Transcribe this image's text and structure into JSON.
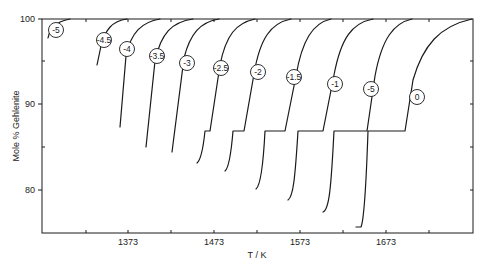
{
  "chart_data": {
    "type": "line",
    "title": "",
    "xlabel": "T / K",
    "ylabel": "Mole % Gehlenite",
    "xlim": [
      1273,
      1773
    ],
    "ylim": [
      75,
      100
    ],
    "x_ticks": [
      1323,
      1373,
      1423,
      1473,
      1523,
      1573,
      1623,
      1673,
      1723
    ],
    "x_tick_labels": [
      "",
      "1373",
      "",
      "1473",
      "",
      "1573",
      "",
      "1673",
      ""
    ],
    "y_ticks": [
      100,
      95,
      90,
      85,
      80
    ],
    "y_tick_labels": [
      "100",
      "",
      "90",
      "",
      "80"
    ],
    "grid": false,
    "legend": "none (curves labelled inline with circled values)",
    "series": [
      {
        "name": "-5",
        "label": "-5",
        "points": [
          [
            1280,
            97.8
          ],
          [
            1290,
            99.0
          ],
          [
            1300,
            99.7
          ],
          [
            1305,
            100
          ]
        ]
      },
      {
        "name": "-4.5",
        "label": "-4.5",
        "points": [
          [
            1337,
            94.4
          ],
          [
            1340,
            96.4
          ],
          [
            1352,
            99.2
          ],
          [
            1370,
            100
          ]
        ]
      },
      {
        "name": "-4",
        "label": "-4",
        "points": [
          [
            1363,
            87.2
          ],
          [
            1370,
            96.0
          ],
          [
            1385,
            99.3
          ],
          [
            1410,
            100
          ]
        ]
      },
      {
        "name": "-3.5",
        "label": "-3.5",
        "points": [
          [
            1392,
            85.0
          ],
          [
            1402,
            95.4
          ],
          [
            1420,
            99.2
          ],
          [
            1447,
            100
          ]
        ]
      },
      {
        "name": "-3",
        "label": "-3",
        "points": [
          [
            1422,
            84.3
          ],
          [
            1435,
            95.0
          ],
          [
            1452,
            99.3
          ],
          [
            1477,
            100
          ]
        ]
      },
      {
        "name": "-2.5",
        "label": "-2.5",
        "points": [
          [
            1451,
            83.0
          ],
          [
            1463,
            86.8
          ],
          [
            1467,
            86.8
          ],
          [
            1480,
            94.7
          ],
          [
            1495,
            99.0
          ],
          [
            1519,
            100
          ]
        ]
      },
      {
        "name": "-2",
        "label": "-2",
        "points": [
          [
            1484,
            82.2
          ],
          [
            1494,
            86.8
          ],
          [
            1507,
            86.8
          ],
          [
            1519,
            93.8
          ],
          [
            1535,
            98.8
          ],
          [
            1561,
            100
          ]
        ]
      },
      {
        "name": "-1.5",
        "label": "-1.5",
        "points": [
          [
            1521,
            80.1
          ],
          [
            1531,
            86.8
          ],
          [
            1554,
            86.8
          ],
          [
            1568,
            93.6
          ],
          [
            1585,
            98.8
          ],
          [
            1607,
            100
          ]
        ]
      },
      {
        "name": "-1",
        "label": "-1",
        "points": [
          [
            1558,
            78.8
          ],
          [
            1569,
            86.8
          ],
          [
            1598,
            86.8
          ],
          [
            1612,
            93.8
          ],
          [
            1630,
            98.8
          ],
          [
            1656,
            100
          ]
        ]
      },
      {
        "name": "-.5",
        "label": "-5",
        "points": [
          [
            1598,
            77.4
          ],
          [
            1611,
            86.8
          ],
          [
            1650,
            86.8
          ],
          [
            1660,
            93.6
          ],
          [
            1678,
            98.8
          ],
          [
            1701,
            100
          ]
        ]
      },
      {
        "name": "0",
        "label": "0",
        "points": [
          [
            1637,
            75.6
          ],
          [
            1650,
            86.8
          ],
          [
            1694,
            86.8
          ],
          [
            1703,
            92.9
          ],
          [
            1730,
            98.6
          ],
          [
            1772,
            100
          ]
        ]
      }
    ]
  },
  "axes": {
    "xlabel": "T / K",
    "ylabel": "Mole % Gehlenite",
    "x_tick_labels": [
      {
        "x": 128,
        "text": "1373"
      },
      {
        "x": 214,
        "text": "1473"
      },
      {
        "x": 300,
        "text": "1573"
      },
      {
        "x": 386,
        "text": "1673"
      }
    ],
    "y_tick_labels": [
      {
        "y": 19,
        "text": "100"
      },
      {
        "y": 104,
        "text": "90"
      },
      {
        "y": 190,
        "text": "80"
      }
    ]
  },
  "curves": [
    {
      "label": "-5",
      "lx": 56,
      "ly": 30,
      "path": "M48,38 C50,28 55,22 70,19"
    },
    {
      "label": "-4.5",
      "lx": 104,
      "ly": 40,
      "path": "M97,65 L101,46 C105,30 112,21 127,19"
    },
    {
      "label": "-4",
      "lx": 127,
      "ly": 49,
      "path": "M120,127 L126,56 C131,32 142,22 160,19"
    },
    {
      "label": "-3.5",
      "lx": 157,
      "ly": 56,
      "path": "M146,147 L155,61 C161,33 172,22 193,19"
    },
    {
      "label": "-3",
      "lx": 187,
      "ly": 63,
      "path": "M172,152 L184,58 C190,34 200,22 219,19"
    },
    {
      "label": "-2.5",
      "lx": 221,
      "ly": 68,
      "path": "M197,163 C201,160 203,150 205,131 L210,131 L220,65 C226,35 236,23 255,19"
    },
    {
      "label": "-2",
      "lx": 258,
      "ly": 72,
      "path": "M225,171 C229,168 231,155 233,131 L244,131 L254,74 C260,38 271,23 291,19"
    },
    {
      "label": "-1.5",
      "lx": 294,
      "ly": 77,
      "path": "M256,189 C260,186 263,170 265,131 L285,131 L296,76 C302,40 313,23 331,19"
    },
    {
      "label": "-1",
      "lx": 335,
      "ly": 84,
      "path": "M288,200 C293,197 295,180 298,131 L323,131 L334,75 C341,38 352,23 373,19"
    },
    {
      "label": "-5",
      "lx": 371,
      "ly": 89,
      "path": "M323,212 C329,210 331,190 334,131 L367,131 L375,76 C382,38 394,23 412,19"
    },
    {
      "label": "0",
      "lx": 417,
      "ly": 97,
      "path": "M356,227 L361,227 C364,220 366,190 368,131 L405,131 L413,80 C423,45 440,26 472,19"
    }
  ]
}
